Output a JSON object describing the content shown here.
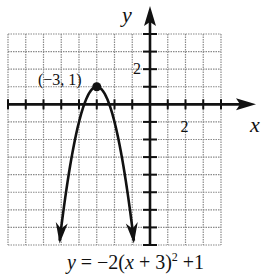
{
  "chart_data": {
    "type": "line",
    "title": "",
    "equation": "y = -2(x + 3)^2 + 1",
    "xlabel": "x",
    "ylabel": "y",
    "xlim": [
      -8,
      4
    ],
    "ylim": [
      -8,
      4
    ],
    "grid": true,
    "grid_step": 1,
    "tick_labels": {
      "x": [
        "2"
      ],
      "y": [
        "2"
      ]
    },
    "vertex": {
      "x": -3,
      "y": 1,
      "label": "(−3, 1)"
    },
    "series": [
      {
        "name": "y = -2(x+3)^2 + 1",
        "x": [
          -5.1,
          -5,
          -4.5,
          -4,
          -3.5,
          -3,
          -2.5,
          -2,
          -1.5,
          -1,
          -0.9
        ],
        "y": [
          -7.82,
          -7,
          -3.5,
          -1,
          0.5,
          1,
          0.5,
          -1,
          -3.5,
          -7,
          -7.82
        ],
        "arrows_both_ends": true
      }
    ]
  },
  "labels": {
    "x_axis": "x",
    "y_axis": "y",
    "x_tick": "2",
    "y_tick": "2",
    "vertex": "(−3, 1)",
    "caption_y": "y",
    "caption_rest": " = −2(",
    "caption_x": "x",
    "caption_plus3": " + 3)",
    "caption_exp": "2",
    "caption_tail": " +1"
  },
  "colors": {
    "ink": "#111111",
    "grid": "#8a8a8a",
    "background": "#ffffff"
  }
}
